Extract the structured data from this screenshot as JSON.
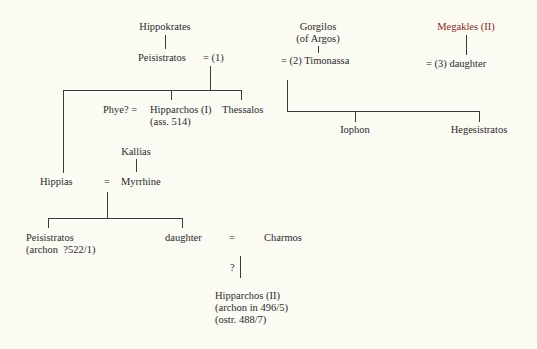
{
  "diagram": {
    "type": "genealogy",
    "accent_color": "#8a2a20",
    "nodes": {
      "hippokrates": "Hippokrates",
      "peisistratos": "Peisistratos",
      "marriage1": "= (1)",
      "gorgilos": "Gorgilos",
      "gorgilos_note": "(of Argos)",
      "timonassa": "= (2) Timonassa",
      "megakles": "Megakles (II)",
      "daughter3": "= (3) daughter",
      "phye": "Phye? =",
      "hipparchos1": "Hipparchos (I)",
      "hipparchos1_note": "(ass. 514)",
      "thessalos": "Thessalos",
      "iophon": "Iophon",
      "hegesistratos": "Hegesistratos",
      "kallias": "Kallias",
      "hippias": "Hippias",
      "hippias_eq": "=",
      "myrrhine": "Myrrhine",
      "peisistratos2": "Peisistratos",
      "peisistratos2_note": "(archon  ?522/1)",
      "daughter": "daughter",
      "daughter_eq": "=",
      "charmos": "Charmos",
      "uncertain": "?",
      "hipparchos2": "Hipparchos (II)",
      "hipparchos2_note1": "(archon in 496/5)",
      "hipparchos2_note2": "(ostr. 488/7)"
    }
  }
}
